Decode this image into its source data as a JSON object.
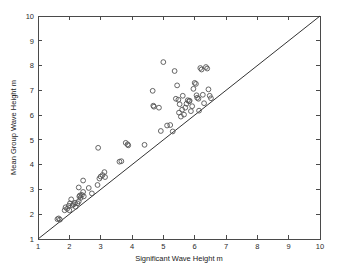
{
  "chart_data": {
    "type": "scatter",
    "title": "",
    "xlabel": "Significant Wave Height   m",
    "ylabel": "Mean Group Wave Height   m",
    "xlim": [
      1,
      10
    ],
    "ylim": [
      1,
      10
    ],
    "xticks": [
      1,
      2,
      3,
      4,
      5,
      6,
      7,
      8,
      9,
      10
    ],
    "yticks": [
      1,
      2,
      3,
      4,
      5,
      6,
      7,
      8,
      9,
      10
    ],
    "xtick_labels": [
      "1",
      "2",
      "3",
      "4",
      "5",
      "6",
      "7",
      "8",
      "9",
      "10"
    ],
    "ytick_labels": [
      "1",
      "2",
      "3",
      "4",
      "5",
      "6",
      "7",
      "8",
      "9",
      "10"
    ],
    "grid": false,
    "legend": null,
    "marker": "open-circle",
    "marker_color": "#555555",
    "reference_line": {
      "label": "1:1 line",
      "x": [
        1,
        10
      ],
      "y": [
        1,
        10
      ],
      "color": "#333333"
    },
    "series": [
      {
        "name": "Wave height observations",
        "points": [
          [
            1.62,
            1.8
          ],
          [
            1.66,
            1.83
          ],
          [
            1.7,
            1.78
          ],
          [
            1.85,
            2.16
          ],
          [
            1.88,
            2.28
          ],
          [
            1.93,
            2.22
          ],
          [
            1.98,
            2.34
          ],
          [
            2.0,
            2.16
          ],
          [
            2.02,
            2.44
          ],
          [
            2.06,
            2.6
          ],
          [
            2.1,
            2.36
          ],
          [
            2.14,
            2.4
          ],
          [
            2.18,
            2.46
          ],
          [
            2.2,
            2.3
          ],
          [
            2.26,
            2.44
          ],
          [
            2.3,
            2.52
          ],
          [
            2.32,
            2.72
          ],
          [
            2.34,
            2.76
          ],
          [
            2.36,
            2.66
          ],
          [
            2.4,
            2.78
          ],
          [
            2.44,
            2.9
          ],
          [
            2.46,
            2.72
          ],
          [
            2.3,
            3.08
          ],
          [
            2.44,
            3.36
          ],
          [
            2.62,
            3.06
          ],
          [
            2.72,
            2.84
          ],
          [
            2.9,
            3.18
          ],
          [
            2.92,
            4.68
          ],
          [
            2.96,
            3.44
          ],
          [
            3.0,
            3.52
          ],
          [
            3.06,
            3.58
          ],
          [
            3.12,
            3.7
          ],
          [
            3.14,
            3.5
          ],
          [
            3.6,
            4.12
          ],
          [
            3.66,
            4.14
          ],
          [
            3.8,
            4.88
          ],
          [
            3.86,
            4.82
          ],
          [
            3.88,
            4.78
          ],
          [
            4.4,
            4.8
          ],
          [
            4.66,
            6.98
          ],
          [
            4.68,
            6.38
          ],
          [
            4.7,
            6.34
          ],
          [
            4.86,
            6.3
          ],
          [
            4.92,
            5.36
          ],
          [
            5.0,
            8.14
          ],
          [
            5.12,
            5.58
          ],
          [
            5.22,
            5.6
          ],
          [
            5.3,
            5.34
          ],
          [
            5.36,
            7.78
          ],
          [
            5.4,
            6.66
          ],
          [
            5.44,
            7.2
          ],
          [
            5.48,
            6.62
          ],
          [
            5.5,
            6.1
          ],
          [
            5.52,
            6.44
          ],
          [
            5.56,
            5.94
          ],
          [
            5.6,
            6.22
          ],
          [
            5.62,
            6.78
          ],
          [
            5.66,
            6.02
          ],
          [
            5.7,
            6.3
          ],
          [
            5.74,
            6.46
          ],
          [
            5.78,
            6.6
          ],
          [
            5.82,
            6.56
          ],
          [
            5.84,
            6.58
          ],
          [
            5.88,
            6.16
          ],
          [
            5.92,
            6.36
          ],
          [
            5.96,
            7.06
          ],
          [
            6.0,
            7.3
          ],
          [
            6.04,
            7.26
          ],
          [
            6.06,
            6.8
          ],
          [
            6.08,
            6.7
          ],
          [
            6.12,
            6.66
          ],
          [
            6.14,
            6.18
          ],
          [
            6.18,
            7.9
          ],
          [
            6.22,
            7.84
          ],
          [
            6.26,
            6.82
          ],
          [
            6.3,
            6.48
          ],
          [
            6.36,
            7.94
          ],
          [
            6.4,
            7.88
          ],
          [
            6.44,
            7.04
          ],
          [
            6.48,
            6.78
          ],
          [
            6.52,
            6.68
          ]
        ]
      }
    ]
  },
  "axes": {
    "x_title": "Significant Wave Height   m",
    "y_title": "Mean Group Wave Height   m"
  }
}
